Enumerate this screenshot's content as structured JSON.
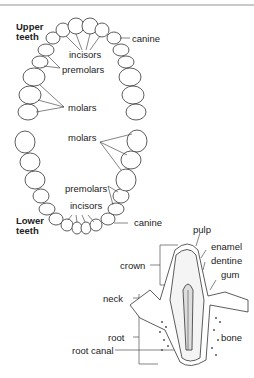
{
  "upper": {
    "title_line1": "Upper",
    "title_line2": "teeth",
    "labels": {
      "canine": "canine",
      "incisors": "incisors",
      "premolars": "premolars",
      "molars": "molars"
    }
  },
  "lower": {
    "title_line1": "Lower",
    "title_line2": "teeth",
    "labels": {
      "molars": "molars",
      "premolars": "premolars",
      "incisors": "incisors",
      "canine": "canine"
    }
  },
  "cross_section": {
    "labels": {
      "pulp": "pulp",
      "enamel": "enamel",
      "dentine": "dentine",
      "gum": "gum",
      "crown": "crown",
      "neck": "neck",
      "root": "root",
      "bone": "bone",
      "root_canal": "root canal"
    }
  }
}
